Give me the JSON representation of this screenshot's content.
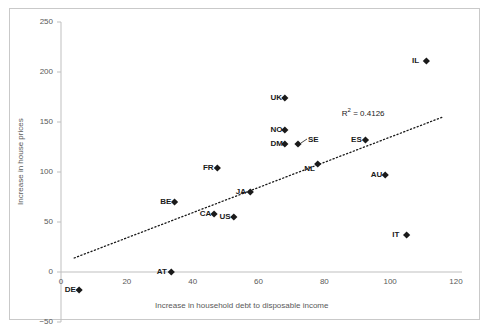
{
  "chart_data": {
    "type": "scatter",
    "title": "",
    "xlabel": "Increase in household debt to disposable income",
    "ylabel": "Increase in house prices",
    "xlim": [
      0,
      120
    ],
    "ylim": [
      -50,
      250
    ],
    "xticks": [
      "0",
      "20",
      "40",
      "60",
      "80",
      "100",
      "120"
    ],
    "yticks": [
      "250",
      "200",
      "150",
      "100",
      "50",
      "0",
      "-50"
    ],
    "ytick_display": [
      "250",
      "200",
      "150",
      "100",
      "50",
      "0",
      "−50"
    ],
    "grid": false,
    "legend": null,
    "marker_shape": "diamond",
    "marker_color": "#1a1a1a",
    "points": [
      {
        "label": "DE",
        "x": 5.5,
        "y": -18,
        "label_pos": "left"
      },
      {
        "label": "AT",
        "x": 33.5,
        "y": 0,
        "label_pos": "left"
      },
      {
        "label": "BE",
        "x": 34.5,
        "y": 70,
        "label_pos": "left"
      },
      {
        "label": "CA",
        "x": 46.5,
        "y": 58,
        "label_pos": "left"
      },
      {
        "label": "FR",
        "x": 47.5,
        "y": 104,
        "label_pos": "left"
      },
      {
        "label": "US",
        "x": 52.5,
        "y": 55,
        "label_pos": "left"
      },
      {
        "label": "JA",
        "x": 57.5,
        "y": 80,
        "label_pos": "left"
      },
      {
        "label": "NO",
        "x": 68.0,
        "y": 142,
        "label_pos": "left"
      },
      {
        "label": "DM",
        "x": 68.0,
        "y": 128,
        "label_pos": "left"
      },
      {
        "label": "UK",
        "x": 68.0,
        "y": 174,
        "label_pos": "left"
      },
      {
        "label": "SE",
        "x": 72.0,
        "y": 128,
        "label_pos": "leader"
      },
      {
        "label": "NL",
        "x": 78.0,
        "y": 108,
        "label_pos": "below-left"
      },
      {
        "label": "ES",
        "x": 92.5,
        "y": 132,
        "label_pos": "left"
      },
      {
        "label": "AU",
        "x": 98.5,
        "y": 97,
        "label_pos": "left"
      },
      {
        "label": "IT",
        "x": 105.0,
        "y": 37,
        "label_pos": "left"
      },
      {
        "label": "IL",
        "x": 111.0,
        "y": 211,
        "label_pos": "left"
      }
    ],
    "trendline": {
      "style": "dotted",
      "color": "#1a1a1a",
      "x_start": 4.0,
      "y_start": 14.0,
      "x_end": 116.0,
      "y_end": 155.0
    },
    "annotations": [
      {
        "name": "r-squared",
        "text_prefix": "R",
        "text_sup": "2",
        "text_suffix": " = 0.4126",
        "x": 92.0,
        "y": 160.0
      }
    ]
  }
}
